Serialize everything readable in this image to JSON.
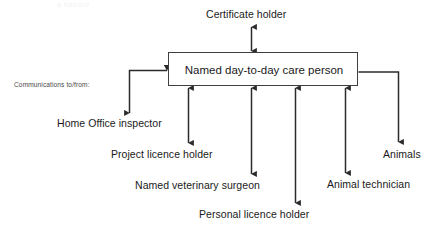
{
  "diagram": {
    "title_fragment": "a hazard",
    "center_node": {
      "label": "Named day-to-day care person"
    },
    "annotation": {
      "text": "Communications to/from:"
    },
    "nodes": [
      {
        "id": "certificate-holder",
        "label": "Certificate holder",
        "arrow": "double",
        "position": "top"
      },
      {
        "id": "home-office-inspector",
        "label": "Home Office inspector",
        "arrow": "elbow-left",
        "position": "left-lower"
      },
      {
        "id": "project-licence-holder",
        "label": "Project licence holder",
        "arrow": "double",
        "position": "bottom"
      },
      {
        "id": "named-veterinary-surgeon",
        "label": "Named veterinary surgeon",
        "arrow": "double",
        "position": "bottom"
      },
      {
        "id": "personal-licence-holder",
        "label": "Personal licence holder",
        "arrow": "single-down",
        "position": "bottom"
      },
      {
        "id": "animal-technician",
        "label": "Animal technician",
        "arrow": "double",
        "position": "bottom"
      },
      {
        "id": "animals",
        "label": "Animals",
        "arrow": "elbow-right",
        "position": "right-lower"
      }
    ],
    "colors": {
      "line": "#2b2b2b",
      "box_border": "#3f3f3f",
      "text": "#1a1a1a",
      "background": "#ffffff"
    }
  }
}
